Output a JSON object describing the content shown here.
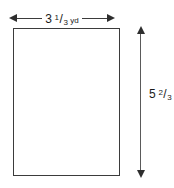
{
  "figure": {
    "type": "rectangle",
    "shape_name": "rectangle",
    "fill_color": "#ffffff",
    "stroke_color": "#3b3b3b",
    "arrow_color": "#2e2e2e",
    "text_color": "#1a1a1a",
    "background_color": "#ffffff"
  },
  "dimensions": {
    "width": {
      "position": "top",
      "orientation": "horizontal",
      "arrow_style": "double-headed",
      "whole": "3",
      "numerator": "1",
      "bar": "/",
      "denominator": "3",
      "unit": "yd",
      "value_text": "3 1/3 yd",
      "value_decimal": 3.3333
    },
    "height": {
      "position": "right",
      "orientation": "vertical",
      "arrow_style": "double-headed",
      "whole": "5",
      "numerator": "2",
      "bar": "/",
      "denominator": "3",
      "unit": "yd",
      "value_text": "5 2/3 yd",
      "value_decimal": 5.6667
    }
  }
}
